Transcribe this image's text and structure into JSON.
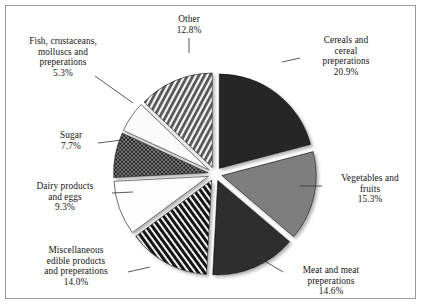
{
  "chart_data": {
    "type": "pie",
    "title": "",
    "subtitle": "",
    "xlabel": "",
    "ylabel": "",
    "legend_position": "none",
    "grid": false,
    "exploded": true,
    "units": "percent",
    "total": 100.0,
    "categories": [
      "Cereals and cereal preperations",
      "Vegetables and fruits",
      "Meat and meat preperations",
      "Miscellaneous edible products and preperations",
      "Dairy products and eggs",
      "Sugar",
      "Fish, crustaceans, molluscs and preperations",
      "Other"
    ],
    "values": [
      20.9,
      15.3,
      14.6,
      14.0,
      9.3,
      7.7,
      5.3,
      12.8
    ],
    "slices": [
      {
        "name": "Cereals and cereal preperations",
        "value": 20.9,
        "label_lines": [
          "Cereals and",
          "cereal",
          "preperations"
        ],
        "percent_text": "20.9%",
        "fill": "#262626",
        "pattern": "solid"
      },
      {
        "name": "Vegetables and fruits",
        "value": 15.3,
        "label_lines": [
          "Vegetables and",
          "fruits"
        ],
        "percent_text": "15.3%",
        "fill": "#7e7e7e",
        "pattern": "solid"
      },
      {
        "name": "Meat and meat preperations",
        "value": 14.6,
        "label_lines": [
          "Meat and meat",
          "preperations"
        ],
        "percent_text": "14.6%",
        "fill": "#2e2e2e",
        "pattern": "solid"
      },
      {
        "name": "Miscellaneous edible products and preperations",
        "value": 14.0,
        "label_lines": [
          "Miscellaneous",
          "edible products",
          "and preperations"
        ],
        "percent_text": "14.0%",
        "fill": "#1c1c1c",
        "pattern": "diagonal-stripes-black"
      },
      {
        "name": "Dairy products and eggs",
        "value": 9.3,
        "label_lines": [
          "Dairy products",
          "and eggs"
        ],
        "percent_text": "9.3%",
        "fill": "#fdfdfd",
        "pattern": "none"
      },
      {
        "name": "Sugar",
        "value": 7.7,
        "label_lines": [
          "Sugar"
        ],
        "percent_text": "7.7%",
        "fill": "#1f1f1f",
        "pattern": "crosshatch-dots"
      },
      {
        "name": "Fish, crustaceans, molluscs and preperations",
        "value": 5.3,
        "label_lines": [
          "Fish, crustaceans,",
          "molluscs and",
          "preperations"
        ],
        "percent_text": "5.3%",
        "fill": "#fbfbfb",
        "pattern": "none"
      },
      {
        "name": "Other",
        "value": 12.8,
        "label_lines": [
          "Other"
        ],
        "percent_text": "12.8%",
        "fill": "#5a5a5a",
        "pattern": "diagonal-stripes-gray"
      }
    ]
  },
  "labels": {
    "cereals": {
      "l1": "Cereals and",
      "l2": "cereal",
      "l3": "preperations",
      "pct": "20.9%"
    },
    "vegetables": {
      "l1": "Vegetables and",
      "l2": "fruits",
      "pct": "15.3%"
    },
    "meat": {
      "l1": "Meat and meat",
      "l2": "preperations",
      "pct": "14.6%"
    },
    "misc": {
      "l1": "Miscellaneous",
      "l2": "edible products",
      "l3": "and preperations",
      "pct": "14.0%"
    },
    "dairy": {
      "l1": "Dairy products",
      "l2": "and eggs",
      "pct": "9.3%"
    },
    "sugar": {
      "l1": "Sugar",
      "pct": "7.7%"
    },
    "fish": {
      "l1": "Fish, crustaceans,",
      "l2": "molluscs and",
      "l3": "preperations",
      "pct": "5.3%"
    },
    "other": {
      "l1": "Other",
      "pct": "12.8%"
    }
  },
  "colors": {
    "frame_border": "#9a9a9a",
    "background": "#ffffff",
    "text": "#141414",
    "leader_line": "#3a3a3a",
    "slice_outline": "#000000"
  }
}
